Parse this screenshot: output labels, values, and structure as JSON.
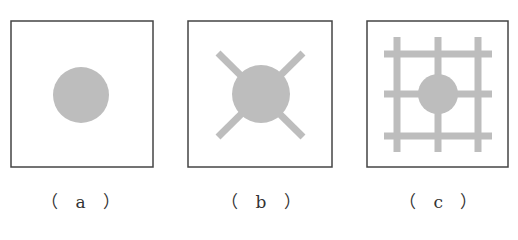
{
  "colors": {
    "frame": "#444444",
    "fill": "#bdbdbd",
    "background": "#ffffff",
    "caption": "#333333"
  },
  "panels": [
    {
      "id": "a",
      "label": "（ a ）",
      "description": "circle only",
      "frame": {
        "x": 11,
        "y": 21,
        "w": 142,
        "h": 146
      },
      "circle": {
        "cx": 81,
        "cy": 95,
        "r": 28
      }
    },
    {
      "id": "b",
      "label": "（ b ）",
      "description": "circle with four diagonal arms",
      "frame": {
        "x": 188,
        "y": 21,
        "w": 144,
        "h": 146
      },
      "circle": {
        "cx": 261,
        "cy": 94,
        "r": 29
      },
      "arms": [
        {
          "x1": 218,
          "y1": 53,
          "x2": 303,
          "y2": 137
        },
        {
          "x1": 303,
          "y1": 53,
          "x2": 218,
          "y2": 137
        }
      ],
      "arm_width": 7
    },
    {
      "id": "c",
      "label": "（ c ）",
      "description": "circle on a 3x3 grid of bars",
      "frame": {
        "x": 367,
        "y": 21,
        "w": 141,
        "h": 146
      },
      "circle": {
        "cx": 438,
        "cy": 94,
        "r": 20
      },
      "vertical_bars_x": [
        397,
        438,
        478
      ],
      "vertical_bars_span": [
        37,
        152
      ],
      "horizontal_bars_y": [
        54,
        94,
        136
      ],
      "horizontal_bars_span": [
        384,
        492
      ],
      "bar_width": 7
    }
  ]
}
